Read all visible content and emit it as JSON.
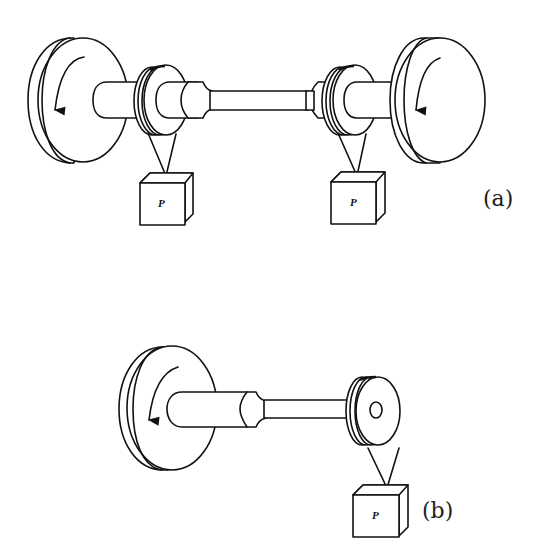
{
  "figure": {
    "panels": [
      {
        "id": "a",
        "label": "(a)",
        "description": "Shaft with two end disks, two pulleys each hanging a weight P",
        "weights": [
          {
            "label": "P"
          },
          {
            "label": "P"
          }
        ],
        "rotation_arrows": [
          "counterclockwise-down",
          "clockwise-down"
        ]
      },
      {
        "id": "b",
        "label": "(b)",
        "description": "Shaft with one end disk and a single pulley hanging a weight P",
        "weights": [
          {
            "label": "P"
          }
        ],
        "rotation_arrows": [
          "counterclockwise-down"
        ]
      }
    ],
    "colors": {
      "line": "#111111",
      "background": "#ffffff"
    }
  }
}
